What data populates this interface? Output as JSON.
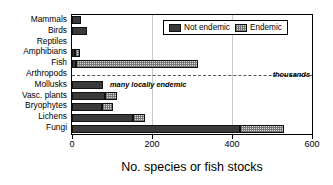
{
  "chart_data": {
    "type": "bar",
    "orientation": "horizontal",
    "stacked": true,
    "title": "",
    "xlabel": "No. species or fish stocks",
    "ylabel": "",
    "xlim": [
      0,
      600
    ],
    "xticks": [
      0,
      200,
      400,
      600
    ],
    "grid": false,
    "legend_position": "top-right",
    "categories": [
      "Mammals",
      "Birds",
      "Reptiles",
      "Amphibians",
      "Fish",
      "Arthropods",
      "Mollusks",
      "Vasc. plants",
      "Bryophytes",
      "Lichens",
      "Fungi"
    ],
    "series": [
      {
        "name": "Not endemic",
        "color": "#3a3a3a",
        "values": [
          22,
          38,
          0,
          8,
          10,
          0,
          78,
          82,
          75,
          153,
          420
        ]
      },
      {
        "name": "Endemic",
        "color": "#d8d8d8",
        "values": [
          0,
          0,
          0,
          12,
          305,
          0,
          0,
          30,
          27,
          30,
          110
        ]
      }
    ],
    "totals": [
      22,
      38,
      0,
      20,
      315,
      0,
      78,
      112,
      102,
      183,
      530
    ],
    "annotations": [
      {
        "text": "thousands",
        "category": "Arthropods",
        "x": 600,
        "style": "bold-italic"
      },
      {
        "text": "many locally endemic",
        "category": "Mollusks",
        "x": 95,
        "style": "bold-italic"
      }
    ],
    "special_marks": [
      {
        "category": "Arthropods",
        "mark": "dashed-line",
        "from": 0,
        "to": 600
      }
    ]
  },
  "legend": {
    "items": [
      {
        "label": "Not endemic",
        "swatch": "dark-solid-swatch"
      },
      {
        "label": "Endemic",
        "swatch": "light-dotted-swatch"
      }
    ]
  },
  "axis": {
    "x_title": "No. species or fish stocks",
    "tick_labels": [
      "0",
      "200",
      "400",
      "600"
    ]
  }
}
